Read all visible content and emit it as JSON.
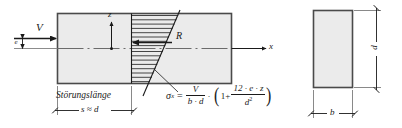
{
  "figure": {
    "title_text": "",
    "colors": {
      "body_fill": "#ebebeb",
      "body_stroke": "#4a4a4a",
      "line": "#1a1a1a",
      "axis": "#555555",
      "background": "#ffffff"
    },
    "elevation_view": {
      "load_label": "V",
      "eccentricity_label": "e",
      "vertical_axis_label": "z",
      "resultant_label": "R",
      "horizontal_axis_label": "x",
      "disturbance_length_label": "Störungslänge",
      "disturbance_length_value": "s ≈ d"
    },
    "cross_section_view": {
      "width_label": "b",
      "depth_label": "d"
    },
    "formula": {
      "lhs_symbol": "σ",
      "lhs_subscript": "x",
      "equals": "=",
      "first_fraction_numerator": "V",
      "first_fraction_denominator": "b · d",
      "multiply_dot": "·",
      "open_paren": "(",
      "one_plus": "1+",
      "second_fraction_numerator": "12 · e · z",
      "second_fraction_denominator": "d",
      "second_fraction_denominator_exponent": "2",
      "close_paren": ")",
      "plain_text": "σx = V/(b·d) · (1 + 12·e·z / d²)"
    }
  }
}
